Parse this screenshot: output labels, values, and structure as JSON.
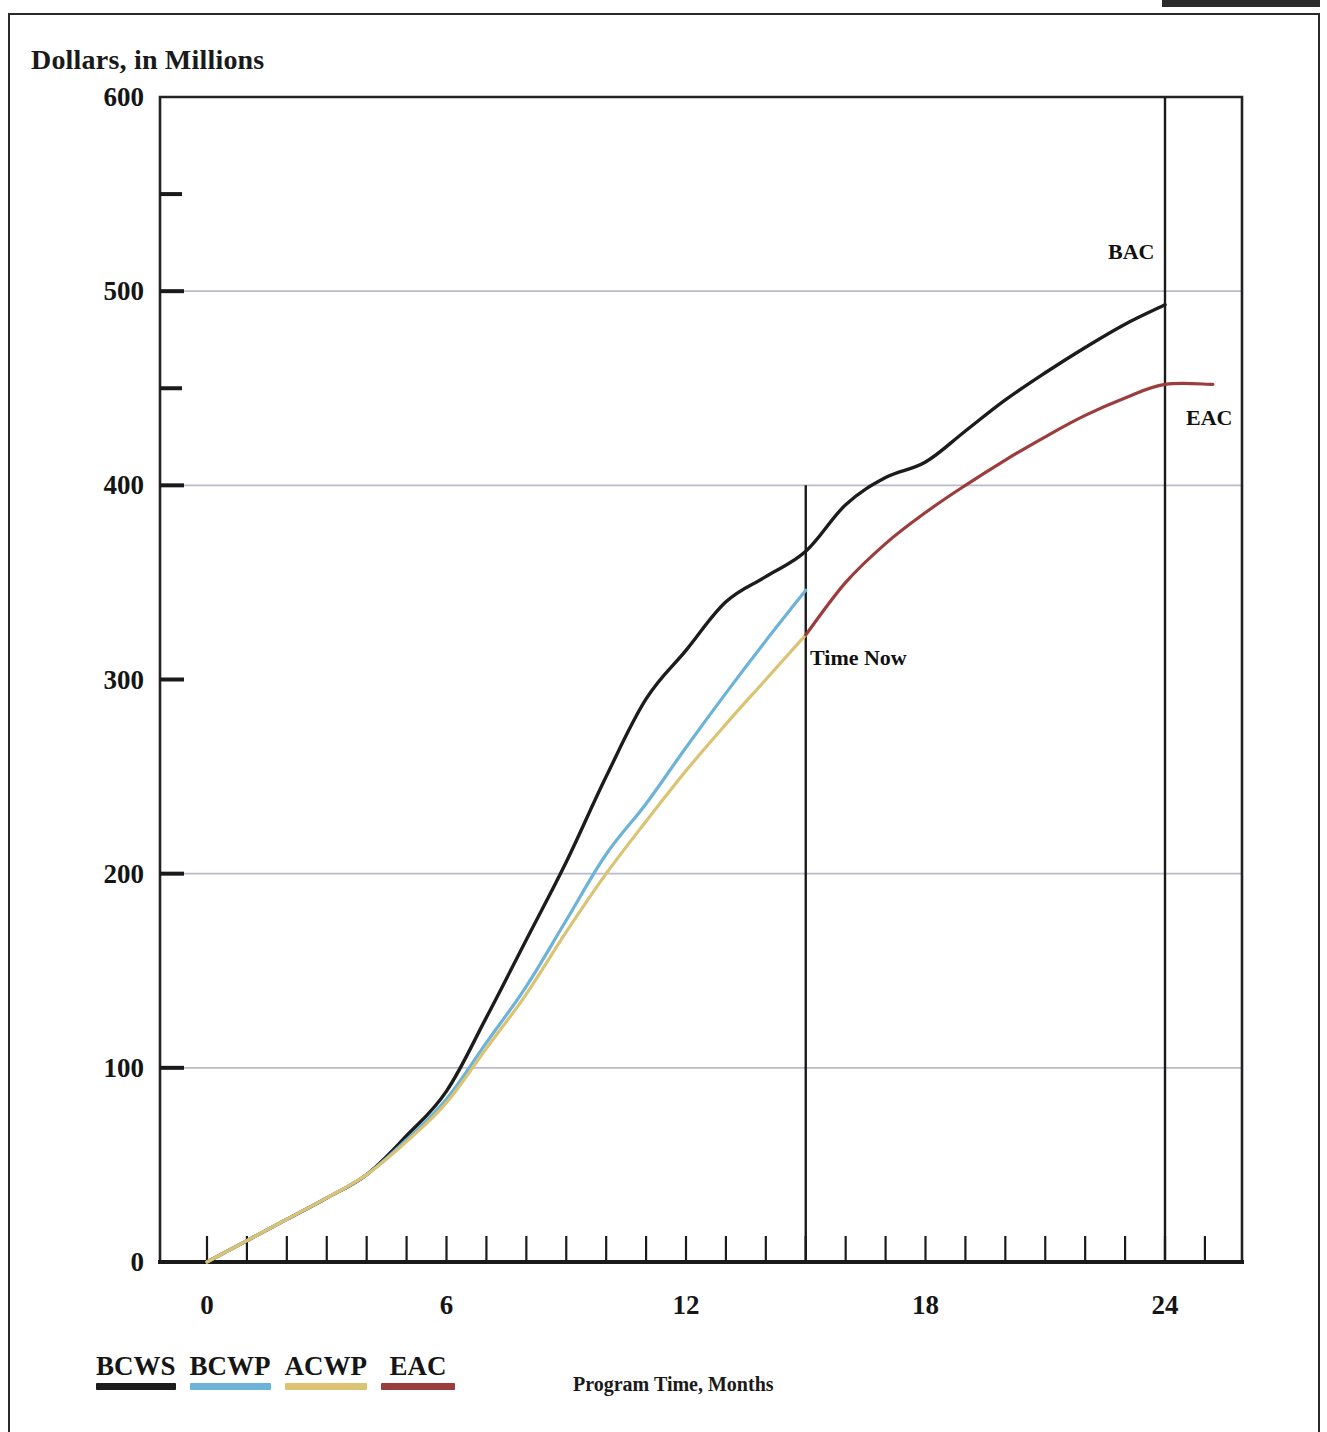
{
  "axes": {
    "y_title": "Dollars, in Millions",
    "x_title": "Program Time, Months",
    "y_ticks": [
      "0",
      "100",
      "200",
      "300",
      "400",
      "500",
      "600"
    ],
    "x_ticks": [
      "0",
      "6",
      "12",
      "18",
      "24"
    ]
  },
  "annotations": {
    "time_now": "Time Now",
    "bac": "BAC",
    "eac": "EAC"
  },
  "legend": {
    "items": [
      {
        "label": "BCWS",
        "color": "#1c1c1c"
      },
      {
        "label": "BCWP",
        "color": "#6db3d9"
      },
      {
        "label": "ACWP",
        "color": "#dcc373"
      },
      {
        "label": "EAC",
        "color": "#9b3d3d"
      }
    ]
  },
  "chart_data": {
    "type": "line",
    "title": "",
    "xlabel": "Program Time, Months",
    "ylabel": "Dollars, in Millions",
    "xlim": [
      0,
      26
    ],
    "ylim": [
      0,
      600
    ],
    "xticks": [
      0,
      6,
      12,
      18,
      24
    ],
    "yticks": [
      0,
      100,
      200,
      300,
      400,
      500,
      600
    ],
    "y_minor_ticks": [
      450,
      550
    ],
    "gridlines_y": [
      100,
      200,
      400,
      500
    ],
    "grid": true,
    "legend_position": "below-left",
    "annotations": [
      {
        "text": "Time Now",
        "x": 15,
        "y": 320,
        "note": "vertical line at month 15"
      },
      {
        "text": "BAC",
        "x": 24,
        "y": 527,
        "note": "budget at completion, BCWS endpoint 493"
      },
      {
        "text": "EAC",
        "x": 24,
        "y": 430,
        "note": "estimate at completion, 452"
      }
    ],
    "vertical_lines": [
      {
        "label": "Time Now",
        "x": 15
      },
      {
        "label": "Completion",
        "x": 24
      }
    ],
    "series": [
      {
        "name": "BCWS",
        "color": "#1c1c1c",
        "x": [
          0,
          1,
          2,
          3,
          4,
          5,
          6,
          7,
          8,
          9,
          10,
          11,
          12,
          13,
          14,
          15,
          16,
          17,
          18,
          19,
          20,
          21,
          22,
          23,
          24
        ],
        "values": [
          0,
          11,
          22,
          33,
          45,
          65,
          88,
          126,
          166,
          206,
          250,
          290,
          315,
          340,
          353,
          366,
          390,
          404,
          412,
          428,
          444,
          458,
          471,
          483,
          493
        ]
      },
      {
        "name": "BCWP",
        "color": "#6db3d9",
        "x": [
          0,
          1,
          2,
          3,
          4,
          5,
          6,
          7,
          8,
          9,
          10,
          11,
          12,
          13,
          14,
          15
        ],
        "values": [
          0,
          11,
          22,
          33,
          45,
          63,
          84,
          113,
          142,
          176,
          210,
          236,
          265,
          293,
          320,
          346
        ]
      },
      {
        "name": "ACWP",
        "color": "#dcc373",
        "x": [
          0,
          1,
          2,
          3,
          4,
          5,
          6,
          7,
          8,
          9,
          10,
          11,
          12,
          13,
          14,
          15
        ],
        "values": [
          0,
          11,
          22,
          33,
          45,
          62,
          82,
          110,
          138,
          170,
          200,
          227,
          253,
          277,
          300,
          323
        ]
      },
      {
        "name": "EAC",
        "color": "#9b3d3d",
        "x": [
          15,
          16,
          17,
          18,
          19,
          20,
          21,
          22,
          23,
          24,
          25.2
        ],
        "values": [
          323,
          350,
          370,
          386,
          400,
          413,
          425,
          436,
          445,
          452,
          452
        ]
      }
    ]
  }
}
